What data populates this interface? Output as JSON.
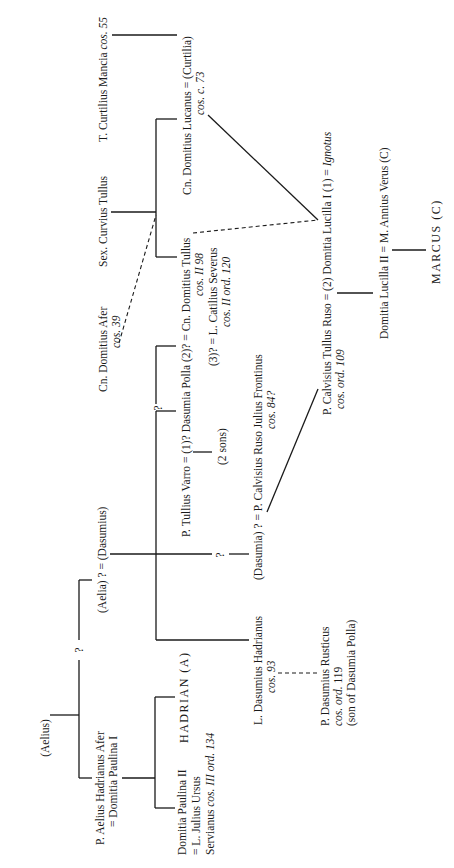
{
  "diagram": {
    "type": "genealogical stemma",
    "orientation": "rotated 90 degrees counter-clockwise",
    "nodes": {
      "aelius": "(Aelius)",
      "q_aelius_branch": "?",
      "aelia_dasumius": "(Aelia) ? = (Dasumius)",
      "q_upper": "?",
      "q_dasumia": "?",
      "p_aelius_line1": "P. Aelius Hadrianus Afer",
      "p_aelius_line2": "= Domitia Paulina I",
      "domitia_paulina_line1": "Domitia Paulina II",
      "domitia_paulina_line2": "= L. Julius Ursus",
      "domitia_paulina_line3_a": "Servianus ",
      "domitia_paulina_line3_b": "cos. III ord. 134",
      "hadrian": "HADRIAN (A)",
      "l_dasumius_line1": "L. Dasumius Hadrianus",
      "l_dasumius_line2": "cos. 93",
      "p_dasumius_line1": "P. Dasumius Rusticus",
      "p_dasumius_line2_a": "cos. ord. ",
      "p_dasumius_line2_b": "119",
      "p_dasumius_line3": "(son of Dasumia Polla)",
      "dasumia_calvisius_line1": "(Dasumia) ? = P. Calvisius Ruso Julius Frontinus",
      "dasumia_calvisius_line2": "cos. 84?",
      "tullius_varro": "P. Tullius Varro = (1)? Dasumia Polla (2)? = Cn. Domitius Tullus",
      "two_sons": "(2 sons)",
      "domitius_tullus_cos": "cos. II 98",
      "catilius_line1": "(3)? = L. Catilius Severus",
      "catilius_line2": "cos. II ord. 120",
      "domitius_afer_line1": "Cn. Domitius Afer",
      "domitius_afer_line2": "cos. 39",
      "curvius_tullus": "Sex. Curvius Tullus",
      "curtilius_mancia_a": "T. Curtilius Mancia ",
      "curtilius_mancia_b": "cos. 55",
      "domitius_lucanus_line1": "Cn. Domitius Lucanus  =  (Curtilia)",
      "domitius_lucanus_line2": "cos. c. 73",
      "calvisius_tullus_line1": "P. Calvisius Tullus Ruso  =  (2) Domitia Lucilla I (1)  =  ",
      "ignotus": "Ignotus",
      "calvisius_tullus_line2": "cos. ord. 109",
      "domitia_lucilla_ii": "Domitia Lucilla II  =  M. Annius Verus (C)",
      "marcus": "MARCUS (C)"
    }
  }
}
